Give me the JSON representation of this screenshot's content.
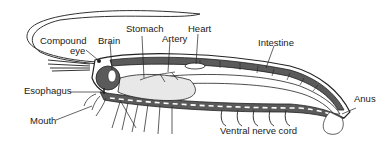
{
  "diagram": {
    "type": "anatomical cross-section",
    "colors": {
      "outline": "#222222",
      "organ_fill": "#5a5a5a",
      "body_fill": "#ffffff",
      "stomach_texture": "#e8e8e8",
      "label_text": "#1a1a1a"
    },
    "labels": {
      "compound_eye_line1": "Compound",
      "compound_eye_line2": "eye",
      "brain": "Brain",
      "stomach": "Stomach",
      "artery": "Artery",
      "heart": "Heart",
      "intestine": "Intestine",
      "esophagus": "Esophagus",
      "mouth": "Mouth",
      "anus": "Anus",
      "ventral_nerve_cord": "Ventral nerve cord"
    }
  }
}
